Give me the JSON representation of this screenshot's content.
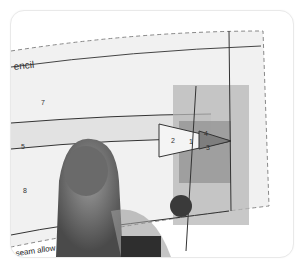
{
  "photo": {
    "subject": "paper sewing pattern with tracing overlay held by thumb",
    "title_text": "encil",
    "bottom_text": "seam allow",
    "region_numbers": [
      "7",
      "5",
      "8",
      "2",
      "4",
      "1",
      "3"
    ],
    "colors": {
      "paper": "#f2f2f2",
      "overlay_gray": "#a8a8a8",
      "overlay_dark": "#8a8a8a",
      "line": "#333333",
      "dot": "#333333",
      "thumb": "#7a7a7a"
    }
  }
}
